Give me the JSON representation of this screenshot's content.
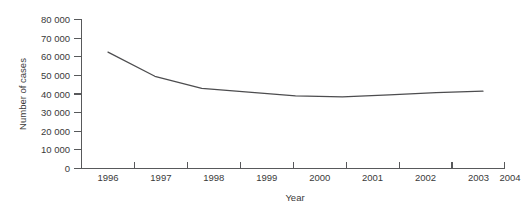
{
  "chart_data": {
    "type": "line",
    "title": "",
    "xlabel": "Year",
    "ylabel": "Number of cases",
    "x": [
      1996,
      1997,
      1998,
      1999,
      2000,
      2001,
      2002,
      2003,
      2004
    ],
    "categories": [
      "1996",
      "1997",
      "1998",
      "1999",
      "2000",
      "2001",
      "2002",
      "2003",
      "2004"
    ],
    "values": [
      62500,
      49500,
      43000,
      41000,
      39000,
      38500,
      39500,
      40800,
      41500
    ],
    "series": [
      {
        "name": "Number of cases",
        "values": [
          62500,
          49500,
          43000,
          41000,
          39000,
          38500,
          39500,
          40800,
          41500
        ]
      }
    ],
    "ylim": [
      0,
      80000
    ],
    "xlim": [
      1996,
      2004
    ],
    "ytick_values": [
      0,
      10000,
      20000,
      30000,
      40000,
      50000,
      60000,
      70000,
      80000
    ],
    "ytick_labels": [
      "0",
      "10 000",
      "20 000",
      "30 000",
      "40 000",
      "50 000",
      "60 000",
      "70 000",
      "80 000"
    ],
    "xtick_labels": [
      "1996",
      "1997",
      "1998",
      "1999",
      "2000",
      "2001",
      "2002",
      "2003",
      "2004"
    ],
    "grid": false,
    "legend": false,
    "legend_position": "none",
    "line_color": "#4d4d4f",
    "axis_color": "#58595b",
    "text_color": "#3a3a3a",
    "background_color": "#ffffff"
  },
  "axes": {
    "y_title": "Number of cases",
    "x_title": "Year",
    "y_labels": {
      "t0": "0",
      "t1": "10 000",
      "t2": "20 000",
      "t3": "30 000",
      "t4": "40 000",
      "t5": "50 000",
      "t6": "60 000",
      "t7": "70 000",
      "t8": "80 000"
    },
    "x_labels": {
      "t0": "1996",
      "t1": "1997",
      "t2": "1998",
      "t3": "1999",
      "t4": "2000",
      "t5": "2001",
      "t6": "2002",
      "t7": "2003",
      "t8": "2004"
    }
  }
}
